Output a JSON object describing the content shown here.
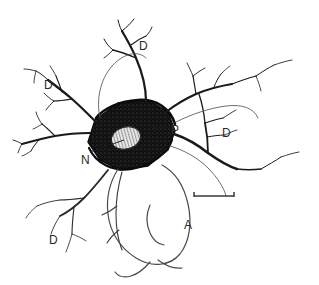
{
  "figure": {
    "type": "scientific-line-drawing",
    "background_color": "#ffffff",
    "ink_color": "#1a1a1a",
    "label_color": "#2b2b2b"
  },
  "labels": [
    {
      "key": "dendrite_top",
      "text": "D",
      "x": 139,
      "y": 40,
      "name": "label-dendrite-top"
    },
    {
      "key": "dendrite_upper_left",
      "text": "D",
      "x": 44,
      "y": 79,
      "name": "label-dendrite-upper-left"
    },
    {
      "key": "dendrite_right",
      "text": "D",
      "x": 222,
      "y": 127,
      "name": "label-dendrite-right"
    },
    {
      "key": "dendrite_lower_left",
      "text": "D",
      "x": 49,
      "y": 234,
      "name": "label-dendrite-lower-left"
    },
    {
      "key": "perikaryon",
      "text": "P",
      "x": 171,
      "y": 124,
      "name": "label-perikaryon"
    },
    {
      "key": "nucleus",
      "text": "N",
      "x": 81,
      "y": 154,
      "name": "label-nucleus"
    },
    {
      "key": "axon",
      "text": "A",
      "x": 184,
      "y": 219,
      "name": "label-axon"
    }
  ],
  "annotations": {
    "perikaryon_arrow": {
      "name": "perikaryon-arrow",
      "direction": "left",
      "from_x": 167,
      "from_y": 128,
      "to_x": 152,
      "to_y": 128
    },
    "nucleus_leader": {
      "name": "nucleus-leader-line",
      "from_x": 90,
      "from_y": 152,
      "to_x": 124,
      "to_y": 139
    }
  },
  "scale_bar": {
    "name": "scale-bar",
    "x1": 194,
    "x2": 234,
    "y": 196,
    "cap_height": 5,
    "caption": ""
  }
}
